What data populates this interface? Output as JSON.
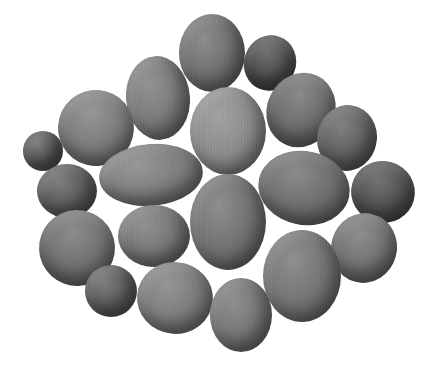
{
  "image": {
    "description": "Grayscale photograph of a cluster of twenty kiwifruits of varying sizes arranged on a white background",
    "background_color": "#ffffff",
    "fruit_count": 20,
    "fruits": [
      {
        "cx": 212,
        "cy": 53,
        "rx": 33,
        "ry": 39,
        "rot": 0,
        "tone": "#6e6e6e"
      },
      {
        "cx": 270,
        "cy": 63,
        "rx": 26,
        "ry": 28,
        "rot": 20,
        "tone": "#4a4a4a"
      },
      {
        "cx": 158,
        "cy": 98,
        "rx": 32,
        "ry": 42,
        "rot": -5,
        "tone": "#777777"
      },
      {
        "cx": 96,
        "cy": 128,
        "rx": 38,
        "ry": 38,
        "rot": 15,
        "tone": "#7a7a7a"
      },
      {
        "cx": 301,
        "cy": 110,
        "rx": 34,
        "ry": 38,
        "rot": 25,
        "tone": "#6a6a6a"
      },
      {
        "cx": 228,
        "cy": 131,
        "rx": 38,
        "ry": 44,
        "rot": 0,
        "tone": "#8a8a8a"
      },
      {
        "cx": 347,
        "cy": 138,
        "rx": 30,
        "ry": 33,
        "rot": 10,
        "tone": "#5e5e5e"
      },
      {
        "cx": 43,
        "cy": 151,
        "rx": 20,
        "ry": 20,
        "rot": 0,
        "tone": "#545454"
      },
      {
        "cx": 151,
        "cy": 175,
        "rx": 52,
        "ry": 31,
        "rot": -5,
        "tone": "#7c7c7c"
      },
      {
        "cx": 304,
        "cy": 188,
        "rx": 46,
        "ry": 37,
        "rot": 10,
        "tone": "#6c6c6c"
      },
      {
        "cx": 383,
        "cy": 192,
        "rx": 32,
        "ry": 31,
        "rot": 15,
        "tone": "#4e4e4e"
      },
      {
        "cx": 67,
        "cy": 191,
        "rx": 30,
        "ry": 27,
        "rot": 0,
        "tone": "#5a5a5a"
      },
      {
        "cx": 228,
        "cy": 222,
        "rx": 38,
        "ry": 48,
        "rot": 0,
        "tone": "#707070"
      },
      {
        "cx": 154,
        "cy": 236,
        "rx": 36,
        "ry": 31,
        "rot": 0,
        "tone": "#747474"
      },
      {
        "cx": 77,
        "cy": 248,
        "rx": 38,
        "ry": 38,
        "rot": 20,
        "tone": "#6e6e6e"
      },
      {
        "cx": 364,
        "cy": 248,
        "rx": 33,
        "ry": 35,
        "rot": 15,
        "tone": "#707070"
      },
      {
        "cx": 302,
        "cy": 276,
        "rx": 39,
        "ry": 46,
        "rot": 0,
        "tone": "#727272"
      },
      {
        "cx": 111,
        "cy": 291,
        "rx": 26,
        "ry": 26,
        "rot": 0,
        "tone": "#5a5a5a"
      },
      {
        "cx": 175,
        "cy": 298,
        "rx": 38,
        "ry": 36,
        "rot": 5,
        "tone": "#7a7a7a"
      },
      {
        "cx": 241,
        "cy": 315,
        "rx": 31,
        "ry": 37,
        "rot": 0,
        "tone": "#737373"
      }
    ]
  }
}
